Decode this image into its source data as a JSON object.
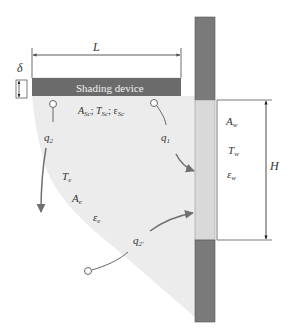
{
  "diagram": {
    "colors": {
      "shading_device": "#6b6b6b",
      "wall": "#7a7a7a",
      "window": "#d9d9d9",
      "region": "#ececec",
      "arrow": "#707070",
      "line": "#444444"
    },
    "dimensions": {
      "length_label": "L",
      "thickness_label": "δ",
      "height_label": "H"
    },
    "shading_device": {
      "label": "Shading device",
      "props_A": "A",
      "props_A_sub": "Sc",
      "props_T": "T",
      "props_T_sub": "Sc",
      "props_eps": "ε",
      "props_eps_sub": "Sc",
      "sep": ";"
    },
    "window": {
      "A": "A",
      "A_sub": "w",
      "T": "T",
      "T_sub": "w",
      "eps": "ε",
      "eps_sub": "w"
    },
    "environment": {
      "T": "T",
      "T_sub": "e",
      "A": "A",
      "A_sub": "e",
      "eps": "ε",
      "eps_sub": "e"
    },
    "heat_flows": [
      {
        "id": "q1",
        "label": "q",
        "sub": "1"
      },
      {
        "id": "q2",
        "label": "q",
        "sub": "2"
      },
      {
        "id": "q2prime",
        "label": "q",
        "sub": "2'"
      }
    ]
  }
}
